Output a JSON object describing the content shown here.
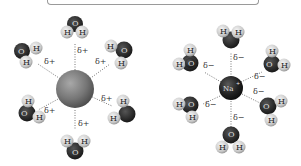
{
  "diagram": {
    "colors": {
      "background": "#ffffff",
      "anion": "#7a7a7a",
      "cation": "#1e1e1e",
      "oxygen": "#262626",
      "hydrogen": "#d6d6d6",
      "dotted_line": "#777777",
      "box_border": "#9a9a9a"
    },
    "left_cluster": {
      "central_ion_label": "",
      "central_ion_type": "anion",
      "charge_label": "δ+",
      "water_count": 6,
      "waters": [
        {
          "pos": "top",
          "atoms": [
            "H",
            "O",
            "H"
          ],
          "delta": "δ+"
        },
        {
          "pos": "upper-left",
          "atoms": [
            "O",
            "H",
            "H"
          ],
          "delta": "δ+"
        },
        {
          "pos": "upper-right",
          "atoms": [
            "H",
            "O",
            "H"
          ],
          "delta": "δ+"
        },
        {
          "pos": "lower-left",
          "atoms": [
            "H",
            "O",
            "H"
          ],
          "delta": "δ+"
        },
        {
          "pos": "lower-right",
          "atoms": [
            "H",
            "H",
            "O"
          ],
          "delta": "δ+"
        },
        {
          "pos": "bottom",
          "atoms": [
            "H",
            "H",
            "O"
          ],
          "delta": "δ+"
        }
      ]
    },
    "right_cluster": {
      "central_ion_label": "Na+",
      "central_ion_type": "cation",
      "charge_label": "δ−",
      "water_count": 6,
      "waters": [
        {
          "pos": "top",
          "atoms": [
            "H",
            "H",
            "O"
          ],
          "delta": "δ−"
        },
        {
          "pos": "upper-left",
          "atoms": [
            "H",
            "H",
            "O"
          ],
          "delta": "δ−"
        },
        {
          "pos": "upper-right",
          "atoms": [
            "H",
            "O",
            "H"
          ],
          "delta": "δ−"
        },
        {
          "pos": "lower-left",
          "atoms": [
            "H",
            "O",
            "H"
          ],
          "delta": "δ−"
        },
        {
          "pos": "lower-right",
          "atoms": [
            "O",
            "H",
            "H"
          ],
          "delta": "δ−"
        },
        {
          "pos": "bottom",
          "atoms": [
            "O",
            "H",
            "H"
          ],
          "delta": "δ−"
        }
      ]
    },
    "labels": {
      "delta_plus": "δ+",
      "delta_minus": "δ−",
      "hydrogen": "H",
      "oxygen": "O",
      "sodium": "Na",
      "sodium_charge": "+"
    }
  }
}
